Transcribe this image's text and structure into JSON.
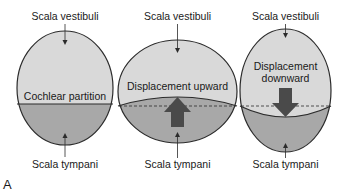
{
  "figure": {
    "panel_label": "A",
    "colors": {
      "upper_fill": "#d9d9d9",
      "lower_fill": "#a8a8a8",
      "outline": "#2b2b2b",
      "arrow_fill": "#4a4a4a",
      "text": "#1a1a1a"
    },
    "panels": [
      {
        "name": "resting",
        "top_label": "Scala vestibuli",
        "bottom_label": "Scala tympani",
        "middle_label": "Cochlear partition"
      },
      {
        "name": "upward",
        "top_label": "Scala vestibuli",
        "bottom_label": "Scala tympani",
        "middle_label": "Displacement upward",
        "arrow_direction": "up"
      },
      {
        "name": "downward",
        "top_label": "Scala vestibuli",
        "bottom_label": "Scala tympani",
        "middle_label_line1": "Displacement",
        "middle_label_line2": "downward",
        "arrow_direction": "down"
      }
    ]
  }
}
